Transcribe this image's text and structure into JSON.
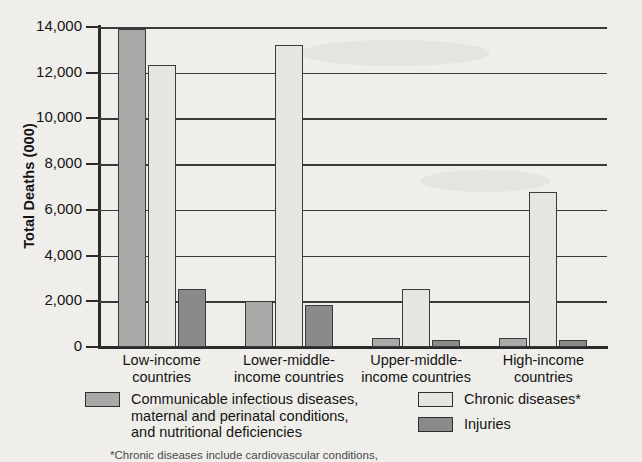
{
  "chart_data": {
    "type": "bar",
    "title": "",
    "xlabel": "",
    "ylabel": "Total Deaths (000)",
    "ylim": [
      0,
      14000
    ],
    "ytick_labels": [
      "14,000",
      "12,000",
      "10,000",
      "8,000",
      "6,000",
      "4,000",
      "2,000",
      "0"
    ],
    "ytick_values": [
      14000,
      12000,
      10000,
      8000,
      6000,
      4000,
      2000,
      0
    ],
    "grid": true,
    "legend_position": "bottom",
    "categories": [
      "Low-income\ncountries",
      "Lower-middle-\nincome countries",
      "Upper-middle-\nincome countries",
      "High-income\ncountries"
    ],
    "series": [
      {
        "name": "Communicable infectious diseases,\nmaternal and perinatal conditions,\nand nutritional deficiencies",
        "color": "#a9a9a7",
        "values": [
          13900,
          2000,
          400,
          380
        ]
      },
      {
        "name": "Chronic diseases*",
        "color": "#e6e5e1",
        "values": [
          12350,
          13200,
          2520,
          6800
        ]
      },
      {
        "name": "Injuries",
        "color": "#8a8a88",
        "values": [
          2560,
          1820,
          310,
          320
        ]
      }
    ],
    "footnote": "*Chronic diseases include cardiovascular conditions,"
  },
  "axis": {
    "y_title": "Total Deaths (000)"
  },
  "legend": {
    "items": [
      {
        "label": "Communicable infectious diseases,\nmaternal and perinatal conditions,\nand nutritional deficiencies"
      },
      {
        "label": "Chronic diseases*"
      },
      {
        "label": "Injuries"
      }
    ]
  },
  "footnote": {
    "text": "*Chronic diseases include cardiovascular conditions,"
  }
}
